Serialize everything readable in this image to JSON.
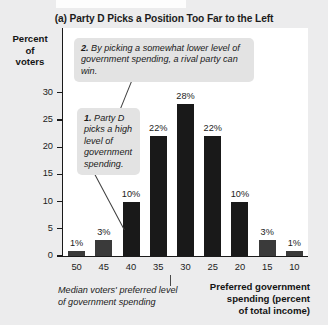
{
  "chart_data": {
    "type": "bar",
    "title": "(a) Party D Picks a Position Too Far to the Left",
    "xlabel": "Preferred government spending (percent of total income)",
    "ylabel": "Percent of voters",
    "categories": [
      "50",
      "45",
      "40",
      "35",
      "30",
      "25",
      "20",
      "15",
      "10"
    ],
    "values": [
      1,
      3,
      10,
      22,
      28,
      22,
      10,
      3,
      1
    ],
    "value_labels": [
      "1%",
      "3%",
      "10%",
      "22%",
      "28%",
      "22%",
      "10%",
      "3%",
      "1%"
    ],
    "ylim": [
      0,
      32
    ],
    "yticks": [
      0,
      5,
      10,
      15,
      20,
      25,
      30
    ],
    "ytick_labels": [
      "0",
      "5",
      "10",
      "15",
      "20",
      "25",
      "30"
    ],
    "grid": false,
    "legend": "none",
    "annotations": [
      {
        "id": "1",
        "number": "1.",
        "text": " Party D picks a high level of government spending.",
        "points_to_category": "45"
      },
      {
        "id": "2",
        "number": "2.",
        "text": " By picking a somewhat lower level of government spending, a rival party can win.",
        "points_to_category": "40"
      }
    ],
    "median_note": "Median voters' preferred level of government spending",
    "median_category": "30"
  },
  "axis": {
    "y_label_lines": [
      "Percent",
      "of",
      "voters"
    ]
  },
  "captions": {
    "median_label": "Median voters' preferred level of government spending",
    "x_axis_lines": [
      "Preferred government",
      "spending (percent",
      "of total income)"
    ]
  },
  "colors": {
    "page_background": "#ececed",
    "plot_background": "#ffffff",
    "bar_fill": "#191919",
    "bar_fill_small": "#3a3a3a",
    "axis": "#1a1a1a",
    "callout_background": "#e3e3e3",
    "text": "#1a1a1a"
  }
}
